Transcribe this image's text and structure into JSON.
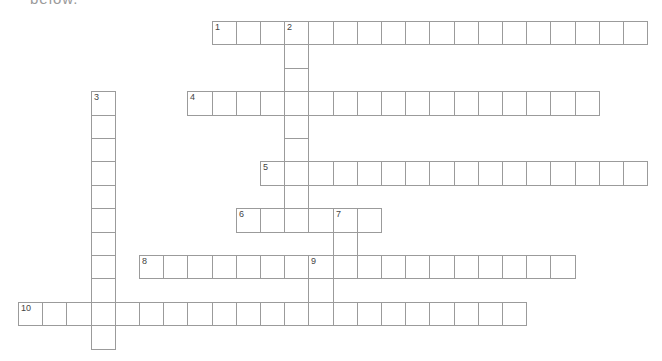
{
  "header": {
    "instruction_fragment": "below."
  },
  "grid": {
    "cell_w": 24.2,
    "cell_h": 23.4,
    "origin_x": 18,
    "origin_y": 21,
    "line_color": "#9b9b9b"
  },
  "words": [
    {
      "number": "1",
      "direction": "across",
      "row": 0,
      "col": 8,
      "length": 18
    },
    {
      "number": "2",
      "direction": "down",
      "row": 0,
      "col": 11,
      "length": 9
    },
    {
      "number": "3",
      "direction": "down",
      "row": 3,
      "col": 3,
      "length": 11
    },
    {
      "number": "4",
      "direction": "across",
      "row": 3,
      "col": 7,
      "length": 17
    },
    {
      "number": "5",
      "direction": "across",
      "row": 6,
      "col": 10,
      "length": 16
    },
    {
      "number": "6",
      "direction": "across",
      "row": 8,
      "col": 9,
      "length": 6
    },
    {
      "number": "7",
      "direction": "down",
      "row": 8,
      "col": 13,
      "length": 3
    },
    {
      "number": "8",
      "direction": "across",
      "row": 10,
      "col": 5,
      "length": 18
    },
    {
      "number": "9",
      "direction": "down",
      "row": 10,
      "col": 12,
      "length": 3
    },
    {
      "number": "10",
      "direction": "across",
      "row": 12,
      "col": 0,
      "length": 21
    }
  ]
}
